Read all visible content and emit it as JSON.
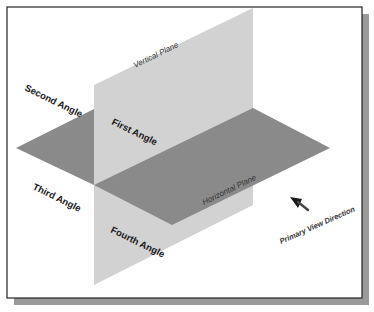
{
  "diagram": {
    "colors": {
      "background": "#ffffff",
      "frame_border": "#222222",
      "shadow": "#9a9a9a",
      "vertical_plane": "#d2d2d2",
      "horizontal_plane": "#8a8a8a",
      "text": "#1a1a1a"
    },
    "planes": {
      "vertical": "Vertical Plane",
      "horizontal": "Horizontal Plane"
    },
    "quadrants": {
      "first": "First Angle",
      "second": "Second Angle",
      "third": "Third Angle",
      "fourth": "Fourth Angle"
    },
    "view_direction": {
      "label": "Primary View Direction",
      "icon": "arrow-icon"
    }
  }
}
